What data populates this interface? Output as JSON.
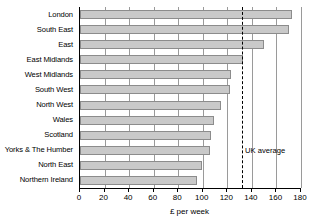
{
  "chart_data": {
    "type": "bar",
    "orientation": "horizontal",
    "title": "",
    "xlabel": "£ per week",
    "ylabel": "",
    "categories": [
      "London",
      "South East",
      "East",
      "East Midlands",
      "West Midlands",
      "South West",
      "North West",
      "Wales",
      "Scotland",
      "Yorks & The Humber",
      "North East",
      "Northern Ireland"
    ],
    "values": [
      173,
      170,
      150,
      133,
      123,
      122,
      115,
      109,
      107,
      106,
      99,
      95
    ],
    "xlim": [
      0,
      180
    ],
    "xticks": [
      0,
      20,
      40,
      60,
      80,
      100,
      120,
      140,
      160,
      180
    ],
    "xtick_labels": [
      "0",
      "20",
      "40",
      "60",
      "80",
      "100",
      "120",
      "140",
      "160",
      "180"
    ],
    "grid": true,
    "legend": null,
    "annotations": [
      {
        "name": "uk-average",
        "label": "UK average",
        "value": 132,
        "style": "dashed-vertical-line"
      }
    ],
    "colors": {
      "bar_fill": "#c9c9c9",
      "bar_border": "#8c8c8c",
      "gridline": "#9a9a9a",
      "axis": "#000000",
      "background": "#ffffff"
    }
  }
}
